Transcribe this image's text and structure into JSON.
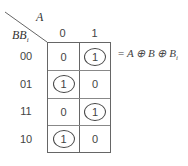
{
  "kmap": {
    "col_var": "A",
    "row_var": "BB",
    "row_var_sub": "i",
    "col_headers": [
      "0",
      "1"
    ],
    "row_headers": [
      "00",
      "01",
      "11",
      "10"
    ],
    "cells": [
      [
        "0",
        "1"
      ],
      [
        "1",
        "0"
      ],
      [
        "0",
        "1"
      ],
      [
        "1",
        "0"
      ]
    ],
    "circled": [
      [
        false,
        true
      ],
      [
        true,
        false
      ],
      [
        false,
        true
      ],
      [
        true,
        false
      ]
    ]
  },
  "equation": {
    "prefix": "= ",
    "text": "A ⊕ B ⊕ B",
    "subscript": "i"
  }
}
